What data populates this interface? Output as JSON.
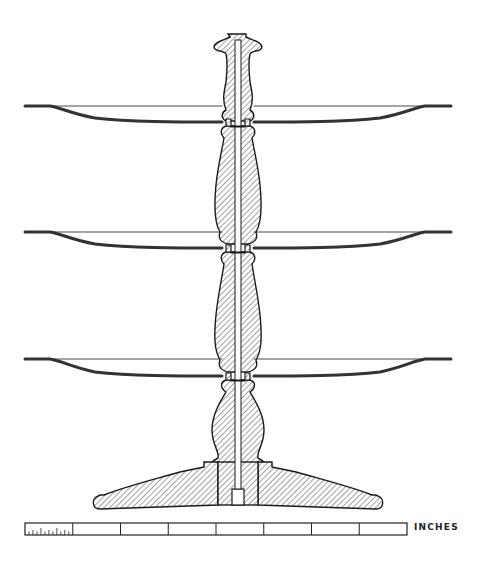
{
  "figure": {
    "tiers": [
      {
        "name": "top-tier"
      },
      {
        "name": "middle-tier"
      },
      {
        "name": "bottom-tier"
      }
    ],
    "parts": [
      "finial",
      "turned-stem",
      "plates",
      "central-rod",
      "domed-base"
    ],
    "hatch_color": "#555555",
    "line_color": "#1a1a1a"
  },
  "scale_bar": {
    "unit_label": "INCHES",
    "segments": 8,
    "first_segment_subdivisions": 12
  }
}
